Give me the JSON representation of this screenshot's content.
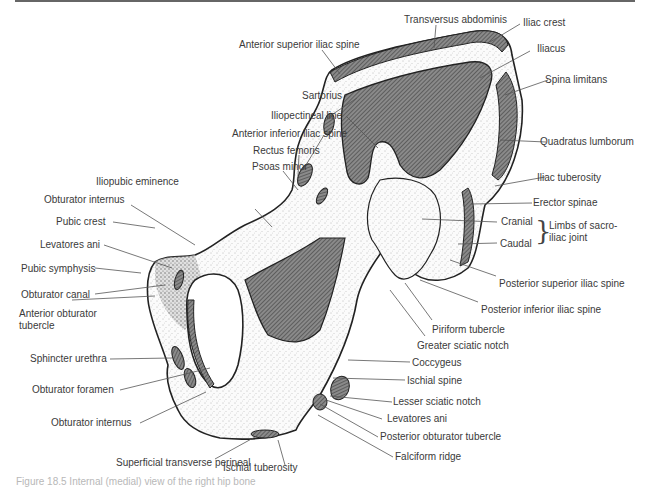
{
  "figure": {
    "caption": "Figure 18.5 Internal (medial) view of the right hip bone"
  },
  "labels": {
    "transversus_abdominis": "Transversus abdominis",
    "anterior_superior_iliac_spine": "Anterior superior iliac spine",
    "iliac_crest": "Iliac crest",
    "iliacus": "Iliacus",
    "sartorius": "Sartorius",
    "spina_limitans": "Spina limitans",
    "iliopectineal_line": "Iliopectineal line",
    "anterior_inferior_iliac_spine": "Anterior inferior iliac spine",
    "quadratus_lumborum": "Quadratus lumborum",
    "rectus_femoris": "Rectus femoris",
    "psoas_minor": "Psoas minor",
    "iliac_tuberosity": "Iliac tuberosity",
    "iliopubic_eminence": "Iliopubic eminence",
    "erector_spinae": "Erector spinae",
    "obturator_internus_upper": "Obturator internus",
    "pubic_crest": "Pubic crest",
    "cranial": "Cranial",
    "limbs_of_sacroiliac_joint": "Limbs of sacro-iliac joint",
    "levatores_ani_left": "Levatores ani",
    "caudal": "Caudal",
    "pubic_symphysis": "Pubic symphysis",
    "obturator_canal": "Obturator canal",
    "posterior_superior_iliac_spine": "Posterior superior iliac spine",
    "anterior_obturator_tubercle": "Anterior obturator tubercle",
    "posterior_inferior_iliac_spine": "Posterior inferior iliac spine",
    "piriform_tubercle": "Piriform tubercle",
    "greater_sciatic_notch": "Greater sciatic notch",
    "sphincter_urethra": "Sphincter urethra",
    "coccygeus": "Coccygeus",
    "obturator_foramen": "Obturator foramen",
    "ischial_spine": "Ischial spine",
    "lesser_sciatic_notch": "Lesser sciatic notch",
    "obturator_internus_lower": "Obturator internus",
    "levatores_ani_right": "Levatores ani",
    "posterior_obturator_tubercle": "Posterior obturator tubercle",
    "falciform_ridge": "Falciform ridge",
    "superficial_transverse_perineal": "Superficial transverse perineal",
    "ischial_tuberosity": "Ischial tuberosity"
  },
  "colors": {
    "bone_outline": "#222222",
    "muscle_hatch": "#6a6a6a",
    "leader_line": "#555555",
    "label_text": "#3a3a3a"
  }
}
